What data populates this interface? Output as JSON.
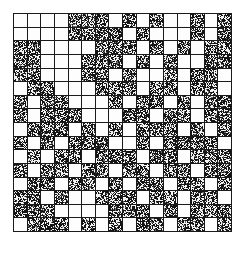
{
  "figure": {
    "rows": 16,
    "columns": 16,
    "cell_size_px": 13.7,
    "grid_origin": {
      "x": 13,
      "y": 13
    },
    "grid_size_px": 219,
    "colors": {
      "background": "#ffffff",
      "border": "#1a1a1a",
      "empty_cell": "#fdfdfd",
      "noise_dark": "#151515",
      "noise_light": "#ededed"
    },
    "legend": {
      "empty_label": "empty",
      "filled_label": "noise"
    }
  },
  "chart_data": {
    "type": "heatmap",
    "xlabel": "",
    "ylabel": "",
    "categories_x": [
      "1",
      "2",
      "3",
      "4",
      "5",
      "6",
      "7",
      "8",
      "9",
      "10",
      "11",
      "12",
      "13",
      "14",
      "15",
      "16"
    ],
    "categories_y": [
      "1",
      "2",
      "3",
      "4",
      "5",
      "6",
      "7",
      "8",
      "9",
      "10",
      "11",
      "12",
      "13",
      "14",
      "15",
      "16"
    ],
    "value_legend": {
      "0": "empty",
      "1": "noise-filled"
    },
    "matrix": [
      [
        0,
        0,
        0,
        0,
        1,
        1,
        1,
        0,
        1,
        0,
        1,
        0,
        0,
        1,
        0,
        1
      ],
      [
        0,
        0,
        0,
        0,
        1,
        1,
        1,
        1,
        0,
        1,
        0,
        0,
        0,
        1,
        0,
        1
      ],
      [
        1,
        1,
        0,
        0,
        0,
        0,
        1,
        1,
        1,
        0,
        1,
        0,
        1,
        0,
        1,
        1
      ],
      [
        1,
        1,
        0,
        0,
        0,
        1,
        1,
        1,
        0,
        1,
        0,
        1,
        0,
        0,
        1,
        1
      ],
      [
        1,
        1,
        0,
        0,
        0,
        1,
        1,
        0,
        1,
        0,
        0,
        1,
        0,
        1,
        1,
        0
      ],
      [
        0,
        1,
        1,
        0,
        0,
        0,
        1,
        1,
        1,
        0,
        1,
        1,
        0,
        1,
        1,
        0
      ],
      [
        1,
        0,
        1,
        1,
        0,
        0,
        0,
        1,
        0,
        1,
        1,
        0,
        1,
        0,
        1,
        1
      ],
      [
        1,
        0,
        1,
        1,
        1,
        0,
        0,
        0,
        1,
        1,
        0,
        1,
        1,
        0,
        1,
        1
      ],
      [
        0,
        1,
        1,
        1,
        0,
        1,
        0,
        1,
        0,
        1,
        1,
        1,
        0,
        1,
        0,
        1
      ],
      [
        1,
        0,
        1,
        0,
        1,
        1,
        1,
        0,
        0,
        1,
        0,
        1,
        1,
        1,
        1,
        0
      ],
      [
        0,
        1,
        0,
        1,
        1,
        0,
        1,
        1,
        1,
        0,
        1,
        1,
        0,
        1,
        1,
        1
      ],
      [
        1,
        0,
        1,
        1,
        0,
        1,
        1,
        0,
        1,
        1,
        0,
        1,
        1,
        0,
        1,
        1
      ],
      [
        0,
        1,
        1,
        0,
        1,
        1,
        0,
        1,
        0,
        1,
        1,
        0,
        1,
        1,
        0,
        1
      ],
      [
        1,
        1,
        0,
        1,
        0,
        0,
        1,
        1,
        1,
        0,
        1,
        1,
        0,
        1,
        1,
        0
      ],
      [
        1,
        1,
        1,
        0,
        0,
        0,
        0,
        1,
        1,
        1,
        0,
        1,
        0,
        1,
        1,
        1
      ],
      [
        0,
        1,
        1,
        1,
        0,
        1,
        0,
        1,
        0,
        1,
        1,
        0,
        1,
        1,
        0,
        1
      ]
    ]
  }
}
